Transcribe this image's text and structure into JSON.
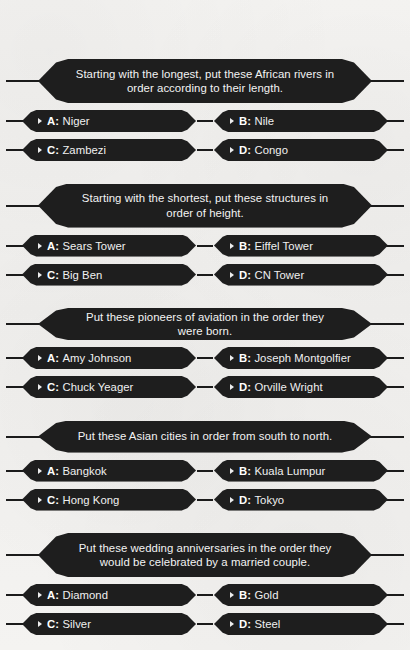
{
  "page": {
    "title": "FASTEST FINGER FIRST",
    "background_color": "#f2f1ef",
    "banner_color": "#1e1e1e",
    "text_color": "#f3f3f3"
  },
  "questions": [
    {
      "number": "41",
      "prompt": "Starting with the longest, put these African rivers in order according to their length.",
      "lines": 2,
      "answers": [
        {
          "letter": "A:",
          "text": "Niger"
        },
        {
          "letter": "B:",
          "text": "Nile"
        },
        {
          "letter": "C:",
          "text": "Zambezi"
        },
        {
          "letter": "D:",
          "text": "Congo"
        }
      ]
    },
    {
      "number": "42",
      "prompt": "Starting with the shortest, put these structures in order of height.",
      "lines": 2,
      "answers": [
        {
          "letter": "A:",
          "text": "Sears Tower"
        },
        {
          "letter": "B:",
          "text": "Eiffel Tower"
        },
        {
          "letter": "C:",
          "text": "Big Ben"
        },
        {
          "letter": "D:",
          "text": "CN Tower"
        }
      ]
    },
    {
      "number": "43",
      "prompt": "Put these pioneers of aviation in the order they were born.",
      "lines": 1,
      "answers": [
        {
          "letter": "A:",
          "text": "Amy Johnson"
        },
        {
          "letter": "B:",
          "text": "Joseph Montgolfier"
        },
        {
          "letter": "C:",
          "text": "Chuck Yeager"
        },
        {
          "letter": "D:",
          "text": "Orville Wright"
        }
      ]
    },
    {
      "number": "44",
      "prompt": "Put these Asian cities in order from south to north.",
      "lines": 1,
      "answers": [
        {
          "letter": "A:",
          "text": "Bangkok"
        },
        {
          "letter": "B:",
          "text": "Kuala Lumpur"
        },
        {
          "letter": "C:",
          "text": "Hong Kong"
        },
        {
          "letter": "D:",
          "text": "Tokyo"
        }
      ]
    },
    {
      "number": "45",
      "prompt": "Put these wedding anniversaries in the order they would be celebrated by a married couple.",
      "lines": 2,
      "answers": [
        {
          "letter": "A:",
          "text": "Diamond"
        },
        {
          "letter": "B:",
          "text": "Gold"
        },
        {
          "letter": "C:",
          "text": "Silver"
        },
        {
          "letter": "D:",
          "text": "Steel"
        }
      ]
    }
  ]
}
